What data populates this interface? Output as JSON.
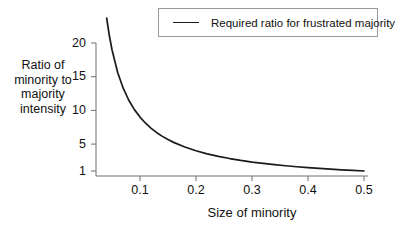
{
  "chart_data": {
    "type": "line",
    "title": "",
    "xlabel": "Size of minority",
    "ylabel": "Ratio of minority to majority intensity",
    "xlim": [
      0.03,
      0.5
    ],
    "ylim": [
      1,
      24
    ],
    "grid": false,
    "legend_position": "top-right",
    "xticks": [
      "0.1",
      "0.2",
      "0.3",
      "0.4",
      "0.5"
    ],
    "xtick_values": [
      0.1,
      0.2,
      0.3,
      0.4,
      0.5
    ],
    "yticks": [
      "20",
      "15",
      "10",
      "5",
      "1"
    ],
    "ytick_values": [
      20,
      15,
      10,
      5,
      1
    ],
    "series": [
      {
        "name": "Required ratio for frustrated majority",
        "color": "#1a1a1a",
        "formula": "(1 - p) / p",
        "x": [
          0.03,
          0.035,
          0.04,
          0.045,
          0.05,
          0.06,
          0.07,
          0.08,
          0.09,
          0.1,
          0.11,
          0.12,
          0.13,
          0.14,
          0.15,
          0.16,
          0.18,
          0.2,
          0.22,
          0.24,
          0.26,
          0.28,
          0.3,
          0.32,
          0.34,
          0.36,
          0.38,
          0.4,
          0.42,
          0.44,
          0.46,
          0.48,
          0.5
        ],
        "y": [
          32.33,
          27.57,
          24.0,
          21.22,
          19.0,
          15.67,
          13.29,
          11.5,
          10.11,
          9.0,
          8.09,
          7.33,
          6.69,
          6.14,
          5.67,
          5.25,
          4.56,
          4.0,
          3.55,
          3.17,
          2.85,
          2.57,
          2.33,
          2.13,
          1.94,
          1.78,
          1.63,
          1.5,
          1.38,
          1.27,
          1.17,
          1.08,
          1.0
        ]
      }
    ]
  },
  "ylabel_lines": {
    "l1": "Ratio of",
    "l2": "minority to",
    "l3": "majority",
    "l4": "intensity"
  },
  "legend": {
    "entry_label": "Required ratio for frustrated majority"
  },
  "xlabel_text": "Size of minority",
  "ytick_labels": {
    "t20": "20",
    "t15": "15",
    "t10": "10",
    "t5": "5",
    "t1": "1"
  },
  "xtick_labels": {
    "t1": "0.1",
    "t2": "0.2",
    "t3": "0.3",
    "t4": "0.4",
    "t5": "0.5"
  }
}
